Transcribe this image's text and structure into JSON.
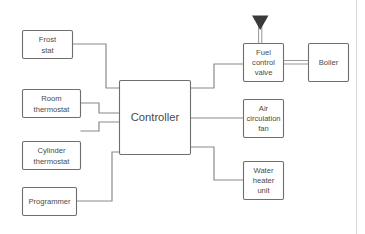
{
  "diagram": {
    "colors": {
      "background": "#ffffff",
      "box_stroke": "#6e6e6e",
      "connector": "#8a8a8a",
      "pipe": "#9a9a9a",
      "marker": "#3a3a3a",
      "label_text": "#4a4a4a",
      "page_border": "#d7d7d7"
    },
    "inputs": [
      {
        "id": "frost-stat",
        "lines": [
          "Frost",
          "stat"
        ]
      },
      {
        "id": "room-thermostat",
        "lines": [
          "Room",
          "thermostat"
        ]
      },
      {
        "id": "cylinder-thermostat",
        "lines": [
          "Cylinder",
          "thermostat"
        ]
      },
      {
        "id": "programmer",
        "lines": [
          "Programmer"
        ]
      }
    ],
    "controller": {
      "id": "controller",
      "lines": [
        "Controller"
      ]
    },
    "outputs": [
      {
        "id": "fuel-control-valve",
        "lines": [
          "Fuel",
          "control",
          "valve"
        ]
      },
      {
        "id": "boiler",
        "lines": [
          "Boiler"
        ]
      },
      {
        "id": "air-circulation-fan",
        "lines": [
          "Air",
          "circulation",
          "fan"
        ]
      },
      {
        "id": "water-heater-unit",
        "lines": [
          "Water",
          "heater",
          "unit"
        ]
      }
    ],
    "markers": [
      {
        "id": "gas-supply-marker",
        "shape": "filled-down-triangle"
      }
    ]
  }
}
